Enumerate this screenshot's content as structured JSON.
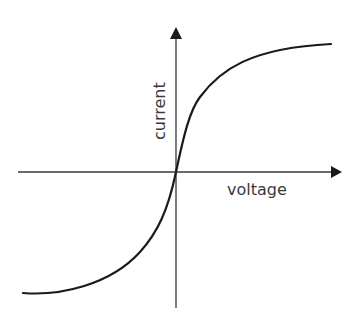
{
  "diagram": {
    "type": "iv-characteristic-curve",
    "x_axis_label": "voltage",
    "y_axis_label": "current",
    "colors": {
      "background": "#ffffff",
      "axis": "#3a3a3a",
      "curve": "#1a1a1a",
      "text": "#3a3a3a"
    },
    "curve_shape": "sigmoid through origin, saturating at both ends"
  }
}
